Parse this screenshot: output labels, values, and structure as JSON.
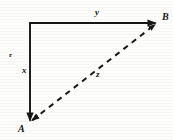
{
  "figure": {
    "background_color": "#fdfdfc",
    "ink_color": "#161616",
    "labels": {
      "vertex_a": "A",
      "vertex_b": "B",
      "side_horizontal": "y",
      "side_vertical": "x",
      "side_hypotenuse": "z",
      "tick_mark": "r"
    }
  },
  "chart_data": {
    "type": "diagram",
    "title": "",
    "xlabel": "",
    "ylabel": "",
    "grid": false,
    "legend": null,
    "xlim": [
      0,
      173
    ],
    "ylim": [
      140,
      0
    ],
    "points": [
      {
        "name": "corner",
        "label": "",
        "x": 30,
        "y": 23
      },
      {
        "name": "vertex_b",
        "label": "B",
        "x": 157,
        "y": 23
      },
      {
        "name": "vertex_a",
        "label": "A",
        "x": 30,
        "y": 122
      }
    ],
    "segments": [
      {
        "name": "side-y",
        "label": "y",
        "from": "corner",
        "to": "vertex_b",
        "style": "solid",
        "arrow_at": "to",
        "x1": 30,
        "y1": 23,
        "x2": 157,
        "y2": 23
      },
      {
        "name": "side-x",
        "label": "x",
        "from": "corner",
        "to": "vertex_a",
        "style": "solid",
        "arrow_at": "to",
        "x1": 30,
        "y1": 23,
        "x2": 30,
        "y2": 122
      },
      {
        "name": "side-z",
        "label": "z",
        "from": "vertex_a",
        "to": "vertex_b",
        "style": "dashed",
        "arrow_at": "both",
        "x1": 30,
        "y1": 122,
        "x2": 157,
        "y2": 23
      }
    ],
    "annotations": [
      {
        "name": "tick-r",
        "text": "r",
        "x": 11,
        "y": 57
      }
    ]
  }
}
